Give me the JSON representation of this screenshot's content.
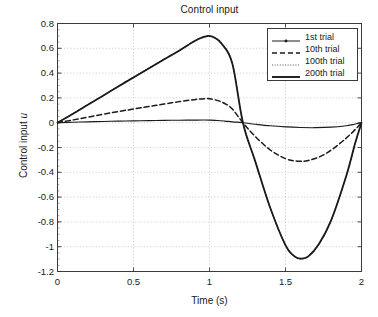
{
  "chart_data": {
    "type": "line",
    "title": "Control input",
    "xlabel": "Time (s)",
    "ylabel": "Control input u",
    "xlim": [
      0,
      2
    ],
    "ylim": [
      -1.2,
      0.8
    ],
    "grid": true,
    "legend_position": "top-right",
    "xticks": [
      "0",
      "0.5",
      "1",
      "1.5",
      "2"
    ],
    "xtick_values": [
      0,
      0.5,
      1,
      1.5,
      2
    ],
    "yticks": [
      "0.8",
      "0.6",
      "0.4",
      "0.2",
      "0",
      "-0.2",
      "-0.4",
      "-0.6",
      "-0.8",
      "-1",
      "-1.2"
    ],
    "ytick_values": [
      0.8,
      0.6,
      0.4,
      0.2,
      0,
      -0.2,
      -0.4,
      -0.6,
      -0.8,
      -1.0,
      -1.2
    ],
    "series": [
      {
        "name": "1st trial",
        "style": "solid-marker",
        "width": 1.1,
        "color": "#1a1a1a",
        "x": [
          0,
          0.1,
          0.2,
          0.3,
          0.4,
          0.5,
          0.6,
          0.7,
          0.8,
          0.9,
          1.0,
          1.05,
          1.1,
          1.15,
          1.22,
          1.3,
          1.4,
          1.5,
          1.6,
          1.7,
          1.8,
          1.9,
          1.95,
          2.0
        ],
        "values": [
          0,
          0.004,
          0.007,
          0.01,
          0.013,
          0.015,
          0.017,
          0.019,
          0.02,
          0.021,
          0.021,
          0.018,
          0.013,
          0.007,
          0.0,
          -0.012,
          -0.025,
          -0.034,
          -0.039,
          -0.04,
          -0.036,
          -0.024,
          -0.014,
          0
        ]
      },
      {
        "name": "10th trial",
        "style": "dashed",
        "width": 1.5,
        "color": "#1a1a1a",
        "x": [
          0,
          0.1,
          0.2,
          0.3,
          0.4,
          0.5,
          0.6,
          0.7,
          0.8,
          0.9,
          0.97,
          1.0,
          1.05,
          1.1,
          1.15,
          1.22,
          1.3,
          1.4,
          1.5,
          1.58,
          1.65,
          1.75,
          1.85,
          1.93,
          2.0
        ],
        "values": [
          0,
          0.022,
          0.045,
          0.068,
          0.09,
          0.11,
          0.13,
          0.15,
          0.17,
          0.186,
          0.194,
          0.193,
          0.18,
          0.155,
          0.11,
          0.0,
          -0.11,
          -0.22,
          -0.29,
          -0.31,
          -0.305,
          -0.26,
          -0.175,
          -0.09,
          0
        ]
      },
      {
        "name": "100th trial",
        "style": "dotted",
        "width": 1.1,
        "color": "#555555",
        "x": [
          0,
          0.1,
          0.2,
          0.3,
          0.4,
          0.5,
          0.6,
          0.7,
          0.8,
          0.9,
          0.95,
          0.98,
          1.0,
          1.03,
          1.08,
          1.15,
          1.22,
          1.3,
          1.4,
          1.5,
          1.56,
          1.6,
          1.65,
          1.72,
          1.8,
          1.9,
          1.96,
          2.0
        ],
        "values": [
          0,
          0.072,
          0.146,
          0.22,
          0.295,
          0.368,
          0.44,
          0.512,
          0.583,
          0.66,
          0.688,
          0.699,
          0.7,
          0.69,
          0.64,
          0.48,
          0.0,
          -0.31,
          -0.69,
          -0.99,
          -1.08,
          -1.098,
          -1.08,
          -0.98,
          -0.79,
          -0.43,
          -0.16,
          0
        ]
      },
      {
        "name": "200th trial",
        "style": "solid",
        "width": 1.8,
        "color": "#1a1a1a",
        "x": [
          0,
          0.1,
          0.2,
          0.3,
          0.4,
          0.5,
          0.6,
          0.7,
          0.8,
          0.9,
          0.95,
          0.98,
          1.0,
          1.03,
          1.08,
          1.15,
          1.22,
          1.3,
          1.4,
          1.5,
          1.56,
          1.6,
          1.65,
          1.72,
          1.8,
          1.9,
          1.96,
          2.0
        ],
        "values": [
          0,
          0.07,
          0.144,
          0.218,
          0.292,
          0.365,
          0.437,
          0.51,
          0.581,
          0.657,
          0.686,
          0.697,
          0.699,
          0.688,
          0.637,
          0.477,
          0.0,
          -0.308,
          -0.688,
          -0.988,
          -1.078,
          -1.096,
          -1.078,
          -0.978,
          -0.788,
          -0.428,
          -0.158,
          0
        ]
      }
    ],
    "annotations": {
      "peak_label": "0.70 at t=1.0",
      "trough_label": "-1.10 at t=1.60",
      "zero_crossing": "t=1.22"
    }
  },
  "legend": {
    "entries": [
      {
        "label": "1st trial"
      },
      {
        "label": "10th trial"
      },
      {
        "label": "100th trial"
      },
      {
        "label": "200th trial"
      }
    ]
  }
}
